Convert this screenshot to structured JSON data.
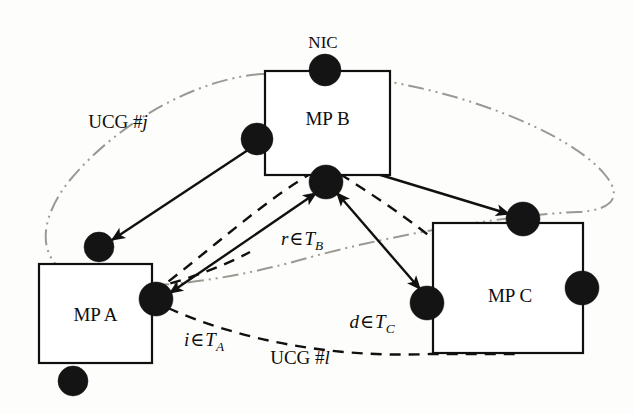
{
  "figure": {
    "background_color": "#fdfdfb",
    "stroke_color": "#101010",
    "ucg_ellipse_color": "#9a9a93"
  },
  "boxes": [
    {
      "id": "mp-a",
      "label": "MP A",
      "x": 39,
      "y": 264,
      "width": 113,
      "height": 99
    },
    {
      "id": "mp-b",
      "label": "MP B",
      "x": 265,
      "y": 71,
      "width": 125,
      "height": 104
    },
    {
      "id": "mp-c",
      "label": "MP C",
      "x": 433,
      "y": 223,
      "width": 150,
      "height": 130
    }
  ],
  "nodes": [
    {
      "id": "nic-b",
      "cx": 325,
      "cy": 70,
      "r": 16,
      "owner": "mp-b"
    },
    {
      "id": "b-left",
      "cx": 257,
      "cy": 139,
      "r": 16,
      "owner": "mp-b"
    },
    {
      "id": "b-bottom",
      "cx": 326,
      "cy": 182,
      "r": 17,
      "owner": "mp-b"
    },
    {
      "id": "a-top",
      "cx": 99,
      "cy": 247,
      "r": 15,
      "owner": "mp-a"
    },
    {
      "id": "a-right",
      "cx": 156,
      "cy": 299,
      "r": 17,
      "owner": "mp-a"
    },
    {
      "id": "a-bottom",
      "cx": 73,
      "cy": 381,
      "r": 15,
      "owner": "mp-a"
    },
    {
      "id": "c-top",
      "cx": 523,
      "cy": 219,
      "r": 17,
      "owner": "mp-c"
    },
    {
      "id": "c-left",
      "cx": 427,
      "cy": 303,
      "r": 17,
      "owner": "mp-c"
    },
    {
      "id": "c-right",
      "cx": 582,
      "cy": 288,
      "r": 17,
      "owner": "mp-c"
    }
  ],
  "labels": {
    "nic": "NIC",
    "ucg_j_prefix": "UCG #",
    "ucg_j_index": "j",
    "ucg_l_prefix": "UCG #",
    "ucg_l_index": "l",
    "r_in_tb": {
      "var": "r",
      "op": "∈",
      "set": "T",
      "sub": "B"
    },
    "i_in_ta": {
      "var": "i",
      "op": "∈",
      "set": "T",
      "sub": "A"
    },
    "d_in_tc": {
      "var": "d",
      "op": "∈",
      "set": "T",
      "sub": "C"
    }
  },
  "label_positions": {
    "nic": {
      "x": 323,
      "y": 42
    },
    "ucg_j": {
      "x": 118,
      "y": 121
    },
    "ucg_l": {
      "x": 300,
      "y": 357
    },
    "r_in_tb": {
      "x": 302,
      "y": 241
    },
    "i_in_ta": {
      "x": 204,
      "y": 342
    },
    "d_in_tc": {
      "x": 372,
      "y": 324
    }
  },
  "edges": [
    {
      "id": "edge-bleft-atop",
      "style": "solid",
      "from": "b-left",
      "to": "a-top",
      "arrow": "to"
    },
    {
      "id": "edge-bleft-cright",
      "style": "solid",
      "from": "c-top",
      "to": "b-left",
      "arrow": "both"
    },
    {
      "id": "edge-bbottom-aright",
      "style": "solid",
      "from": "b-bottom",
      "to": "a-right",
      "arrow": "both"
    },
    {
      "id": "edge-bbottom-cleft",
      "style": "solid",
      "from": "b-bottom",
      "to": "c-left",
      "arrow": "both"
    },
    {
      "id": "edge-ucg-l-a-c",
      "style": "dashed",
      "from": "a-right",
      "to": "mp-c",
      "arrow": "none"
    },
    {
      "id": "edge-ucg-l-b-a",
      "style": "dashed",
      "from": "b-bottom",
      "to": "a-right",
      "arrow": "none"
    },
    {
      "id": "edge-ucg-l-b-c",
      "style": "dashed",
      "from": "b-bottom",
      "to": "mp-c",
      "arrow": "none"
    }
  ],
  "ucg_regions": [
    {
      "id": "ucg-j-region",
      "label": "UCG # j",
      "style": "dash-dot-dot",
      "color": "#9a9a93",
      "spans": [
        "mp-a",
        "mp-b",
        "mp-c"
      ]
    },
    {
      "id": "ucg-l-region",
      "label": "UCG # l",
      "style": "dashed",
      "color": "#101010",
      "spans": [
        "mp-a",
        "mp-b",
        "mp-c"
      ]
    }
  ]
}
